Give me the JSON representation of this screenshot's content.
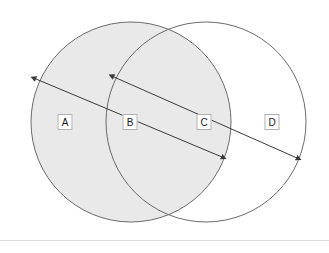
{
  "canvas": {
    "width": 329,
    "height": 253,
    "background": "#ffffff"
  },
  "chart_data": {
    "type": "diagram",
    "subtype": "venn-two-circle-with-dimension-arrows",
    "title": "",
    "circles": [
      {
        "id": "left-circle",
        "cx": 131,
        "cy": 122,
        "r": 100,
        "fill": "#e9e9e9",
        "stroke": "#6b6b6b",
        "filled": true
      },
      {
        "id": "right-circle",
        "cx": 206,
        "cy": 122,
        "r": 100,
        "fill": "none",
        "stroke": "#6b6b6b",
        "filled": false
      }
    ],
    "regions": [
      {
        "key": "A",
        "label": "A",
        "x": 65,
        "y": 122,
        "description": "left-circle-only"
      },
      {
        "key": "B",
        "label": "B",
        "x": 130,
        "y": 122,
        "description": "left-circle-overlap-start"
      },
      {
        "key": "C",
        "label": "C",
        "x": 204,
        "y": 122,
        "description": "overlap-right-edge"
      },
      {
        "key": "D",
        "label": "D",
        "x": 272,
        "y": 122,
        "description": "right-circle-only"
      }
    ],
    "arrows": [
      {
        "key": "arrow-a-to-c",
        "x1": 36,
        "y1": 79,
        "x2": 222,
        "y2": 157,
        "double_headed": true,
        "stroke": "#3a3a3a"
      },
      {
        "key": "arrow-b-to-d",
        "x1": 114,
        "y1": 77,
        "x2": 297,
        "y2": 158,
        "double_headed": true,
        "stroke": "#3a3a3a"
      }
    ],
    "divider": {
      "y": 240,
      "color": "#dcdcdc"
    }
  },
  "colors": {
    "fill_shaded": "#e9e9e9",
    "circle_stroke": "#6b6b6b",
    "arrow_stroke": "#3a3a3a",
    "label_border": "#b0b0b0",
    "label_text": "#1a1a1a",
    "divider": "#dcdcdc",
    "background": "#ffffff"
  }
}
